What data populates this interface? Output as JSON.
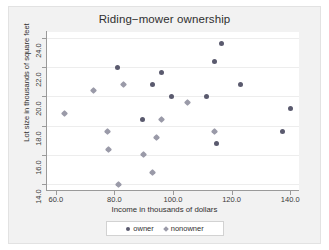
{
  "chart_data": {
    "type": "scatter",
    "title": "Riding−mower ownership",
    "xlabel": "Income in thousands of dollars",
    "ylabel": "Lot size in thousands of square feet",
    "xlim": [
      57.0,
      143.0
    ],
    "ylim": [
      13.6,
      24.4
    ],
    "xticks": [
      "60.0",
      "80.0",
      "100.0",
      "120.0",
      "140.0"
    ],
    "xtick_values": [
      60.0,
      80.0,
      100.0,
      120.0,
      140.0
    ],
    "yticks": [
      "14.0",
      "16.0",
      "18.0",
      "20.0",
      "22.0",
      "24.0"
    ],
    "ytick_values": [
      14.0,
      16.0,
      18.0,
      20.0,
      22.0,
      24.0
    ],
    "grid": "horizontal",
    "legend_position": "bottom",
    "colors": {
      "owner": "#5a5a6e",
      "nonowner": "#9a9aa8",
      "graph_region": "#f2f2f2",
      "plot_region": "#ffffff",
      "gridline": "#ededed",
      "axis": "#9a9a9a"
    },
    "series": [
      {
        "name": "owner",
        "marker": "circle",
        "color": "#5a5a6e",
        "points": [
          [
            81.0,
            22.0
          ],
          [
            89.5,
            18.4
          ],
          [
            93.0,
            20.8
          ],
          [
            96.0,
            21.6
          ],
          [
            99.5,
            20.0
          ],
          [
            111.5,
            20.0
          ],
          [
            114.0,
            22.4
          ],
          [
            116.5,
            23.6
          ],
          [
            115.0,
            16.8
          ],
          [
            123.0,
            20.8
          ],
          [
            137.5,
            17.6
          ],
          [
            140.0,
            19.2
          ]
        ]
      },
      {
        "name": "nonowner",
        "marker": "diamond",
        "color": "#9a9aa8",
        "points": [
          [
            63.0,
            18.8
          ],
          [
            73.0,
            20.4
          ],
          [
            77.5,
            17.6
          ],
          [
            78.0,
            16.4
          ],
          [
            81.5,
            14.0
          ],
          [
            83.0,
            20.8
          ],
          [
            90.0,
            16.0
          ],
          [
            93.0,
            14.8
          ],
          [
            94.5,
            17.2
          ],
          [
            96.0,
            18.4
          ],
          [
            105.0,
            19.6
          ],
          [
            114.0,
            17.6
          ]
        ]
      }
    ]
  },
  "legend": {
    "entries": [
      {
        "label": "owner",
        "marker": "circle"
      },
      {
        "label": "nonowner",
        "marker": "diamond"
      }
    ]
  }
}
